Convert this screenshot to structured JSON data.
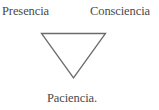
{
  "diagram": {
    "type": "inverted-triangle",
    "vertices": {
      "top_left": {
        "label": "Presencia"
      },
      "top_right": {
        "label": "Consciencia"
      },
      "bottom": {
        "label": "Paciencia."
      }
    },
    "stroke_color": "#6b6b6b",
    "text_color": "#4a4a4a",
    "background_color": "#ffffff"
  }
}
